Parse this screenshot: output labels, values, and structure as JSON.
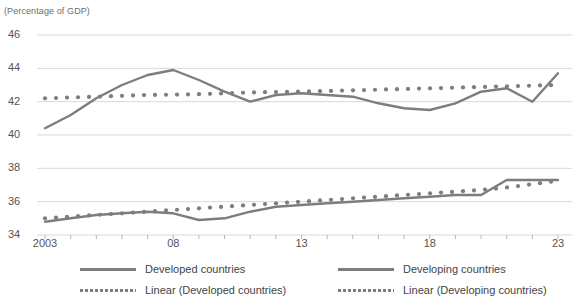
{
  "axis_caption": "(Percentage of GDP)",
  "legend": {
    "items": [
      {
        "label": "Developed countries",
        "style": "solid"
      },
      {
        "label": "Developing countries",
        "style": "solid"
      },
      {
        "label": "Linear (Developed countries)",
        "style": "dotted"
      },
      {
        "label": "Linear (Developing countries)",
        "style": "dotted"
      }
    ]
  },
  "colors": {
    "line": "#7d7d7d",
    "trend": "#7d7d7d",
    "grid": "#d9d9d9",
    "axis": "#b4b4b4",
    "text": "#555555"
  },
  "chart_data": {
    "type": "line",
    "title": "",
    "subtitle": "",
    "xlabel": "",
    "ylabel": "(Percentage of GDP)",
    "ylim": [
      34,
      46
    ],
    "xlim": [
      2003,
      2023
    ],
    "yticks": [
      34,
      36,
      38,
      40,
      42,
      44,
      46
    ],
    "ytick_labels": [
      "34",
      "36",
      "38",
      "40",
      "42",
      "44",
      "46"
    ],
    "xticks": [
      2003,
      2008,
      2013,
      2018,
      2023
    ],
    "xtick_labels": [
      "2003",
      "08",
      "13",
      "18",
      "23"
    ],
    "minor_xticks_every": 1,
    "grid": "horizontal",
    "legend_position": "bottom",
    "x": [
      2003,
      2004,
      2005,
      2006,
      2007,
      2008,
      2009,
      2010,
      2011,
      2012,
      2013,
      2014,
      2015,
      2016,
      2017,
      2018,
      2019,
      2020,
      2021,
      2022,
      2023
    ],
    "series": [
      {
        "name": "Developed countries",
        "style": "solid",
        "values": [
          40.4,
          41.2,
          42.2,
          43.0,
          43.6,
          43.9,
          43.3,
          42.6,
          42.0,
          42.4,
          42.5,
          42.4,
          42.3,
          41.9,
          41.6,
          41.5,
          41.9,
          42.6,
          42.8,
          42.0,
          43.7
        ]
      },
      {
        "name": "Developing countries",
        "style": "solid",
        "values": [
          34.8,
          35.0,
          35.2,
          35.3,
          35.4,
          35.3,
          34.9,
          35.0,
          35.4,
          35.7,
          35.8,
          35.9,
          36.0,
          36.1,
          36.2,
          36.3,
          36.4,
          36.4,
          37.3,
          37.3,
          37.3
        ]
      },
      {
        "name": "Linear (Developed countries)",
        "style": "dotted",
        "values": [
          42.2,
          42.25,
          42.3,
          42.35,
          42.4,
          42.42,
          42.45,
          42.5,
          42.55,
          42.58,
          42.6,
          42.64,
          42.68,
          42.72,
          42.76,
          42.8,
          42.84,
          42.88,
          42.92,
          42.96,
          43.0
        ]
      },
      {
        "name": "Linear (Developing countries)",
        "style": "dotted",
        "values": [
          35.0,
          35.1,
          35.2,
          35.3,
          35.4,
          35.5,
          35.6,
          35.7,
          35.8,
          35.9,
          36.0,
          36.1,
          36.2,
          36.3,
          36.4,
          36.5,
          36.6,
          36.7,
          36.85,
          37.05,
          37.25
        ]
      }
    ]
  }
}
